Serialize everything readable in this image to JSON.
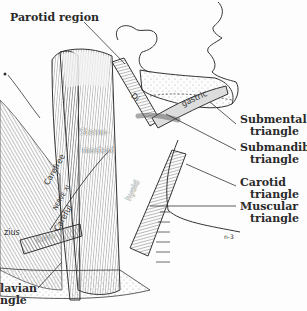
{
  "figure": {
    "colors": {
      "ink": "#2a2a2a",
      "background": "#fdfdfd",
      "stipple": "#9a9a9a"
    }
  },
  "labels": {
    "parotid": "Parotid region",
    "submental": {
      "line1": "Submental",
      "line2": "triangle"
    },
    "submandib": {
      "line1": "Submandib.",
      "line2": "triangle"
    },
    "carotid": {
      "line1": "Carotid",
      "line2": "triangle"
    },
    "muscular": {
      "line1": "Muscular",
      "line2": "triangle"
    },
    "subclavian": {
      "line1": "lavian",
      "line2": "ngle"
    }
  },
  "muscle_labels": {
    "digastric_left": "Di",
    "digastric_right": "gastric",
    "sterno": "Sterno-",
    "mastoid": "mastoid",
    "carefree": "Carefree",
    "nerve": "NERVE XI",
    "careful": "Careful",
    "hyoid": "hyoid",
    "omo": "Omo-",
    "trapezius": "zius",
    "signature": "n-3"
  }
}
